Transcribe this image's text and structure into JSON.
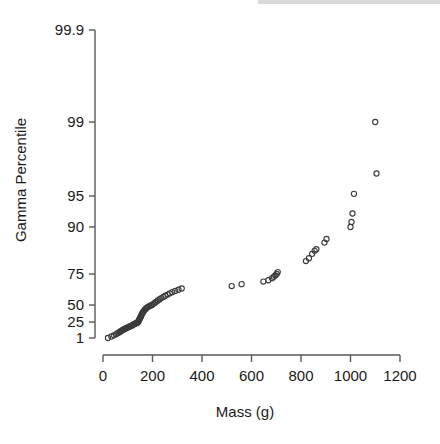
{
  "figure": {
    "background_color": "#ffffff",
    "ink_color": "#1a1a1a",
    "axis_color": "#585858",
    "marker_color": "#3a3a3a"
  },
  "chart_data": {
    "type": "scatter",
    "title": "",
    "subtitle": "",
    "xlabel": "Mass (g)",
    "ylabel": "Gamma Percentile",
    "xlim": [
      -40,
      1240
    ],
    "ylim_percentile": [
      0.6,
      99.93
    ],
    "grid": false,
    "legend": null,
    "xticks": [
      0,
      200,
      400,
      600,
      800,
      1000,
      1200
    ],
    "xticklabels": [
      "0",
      "200",
      "400",
      "600",
      "800",
      "1000",
      "1200"
    ],
    "yticks": [
      1,
      25,
      50,
      75,
      90,
      95,
      99,
      99.9
    ],
    "yticklabels": [
      "1",
      "25",
      "50",
      "75",
      "90",
      "95",
      "99",
      "99.9"
    ],
    "y_scale": "gamma-probability",
    "series": [
      {
        "name": "Mass vs Gamma Percentile",
        "marker": "open-circle",
        "x": [
          20,
          34,
          44,
          52,
          58,
          63,
          68,
          72,
          76,
          80,
          84,
          88,
          92,
          96,
          100,
          104,
          108,
          112,
          116,
          119,
          122,
          125,
          128,
          131,
          134,
          137,
          140,
          142,
          144,
          146,
          148,
          150,
          152,
          154,
          156,
          158,
          160,
          163,
          166,
          170,
          174,
          178,
          183,
          188,
          193,
          198,
          204,
          210,
          216,
          222,
          229,
          236,
          244,
          252,
          261,
          270,
          280,
          292,
          305,
          318,
          520,
          560,
          648,
          668,
          683,
          690,
          696,
          702,
          706,
          820,
          832,
          845,
          855,
          862,
          895,
          903,
          1000,
          1004,
          1008,
          1014,
          1100,
          1105
        ],
        "y_percentile": [
          1.0,
          1.5,
          2.0,
          2.6,
          3.2,
          3.8,
          4.5,
          5.2,
          5.9,
          6.7,
          7.5,
          8.3,
          9.1,
          10.0,
          10.9,
          11.8,
          12.7,
          13.7,
          14.7,
          15.7,
          16.8,
          17.9,
          19.0,
          20.1,
          21.3,
          22.5,
          23.7,
          25.0,
          26.3,
          27.6,
          29.0,
          30.4,
          31.8,
          33.3,
          34.8,
          36.3,
          37.9,
          39.5,
          41.2,
          42.9,
          44.6,
          46.0,
          47.2,
          48.3,
          49.2,
          50.0,
          51.0,
          52.0,
          53.0,
          54.0,
          55.0,
          56.0,
          57.0,
          58.0,
          59.0,
          60.0,
          61.0,
          62.0,
          63.0,
          64.0,
          66.0,
          67.5,
          69.5,
          70.5,
          72.0,
          73.0,
          74.0,
          75.0,
          75.8,
          80.0,
          81.0,
          82.5,
          83.5,
          84.0,
          86.0,
          87.0,
          90.0,
          91.0,
          92.5,
          95.2,
          99.0,
          96.8
        ]
      }
    ]
  },
  "axes": {
    "y_axis_name": "gamma-percentile-axis",
    "x_axis_name": "mass-axis"
  }
}
